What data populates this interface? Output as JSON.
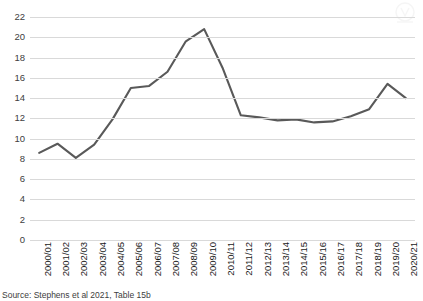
{
  "chart_data": {
    "type": "line",
    "title": "",
    "subtitle": "",
    "xlabel": "",
    "ylabel": "",
    "categories": [
      "2000/01",
      "2001/02",
      "2002/03",
      "2003/04",
      "2004/05",
      "2005/06",
      "2006/07",
      "2007/08",
      "2008/09",
      "2009/10",
      "2010/11",
      "2011/12",
      "2012/13",
      "2013/14",
      "2014/15",
      "2015/16",
      "2016/17",
      "2017/18",
      "2018/19",
      "2019/20",
      "2020/21"
    ],
    "series": [
      {
        "name": "",
        "values": [
          8.6,
          9.5,
          8.1,
          9.4,
          11.9,
          15.0,
          15.2,
          16.6,
          19.6,
          20.8,
          17.0,
          12.3,
          12.1,
          11.8,
          11.9,
          11.6,
          11.7,
          12.2,
          12.9,
          15.4,
          14.0
        ]
      }
    ],
    "ylim": [
      0,
      22
    ],
    "yticks": [
      0,
      2,
      4,
      6,
      8,
      10,
      12,
      14,
      16,
      18,
      20,
      22
    ],
    "ytick_labels": [
      "0",
      "2",
      "4",
      "6",
      "8",
      "10",
      "12",
      "14",
      "16",
      "18",
      "20",
      "22"
    ],
    "grid": true,
    "grid_axis": "y",
    "legend": false,
    "legend_position": "none",
    "line_color": "#595959",
    "grid_color": "#d9d9d9",
    "text_color": "#404040"
  },
  "source": {
    "note": "Source: Stephens et al 2021, Table 15b"
  },
  "watermark": {
    "label": "watermark-logo"
  }
}
